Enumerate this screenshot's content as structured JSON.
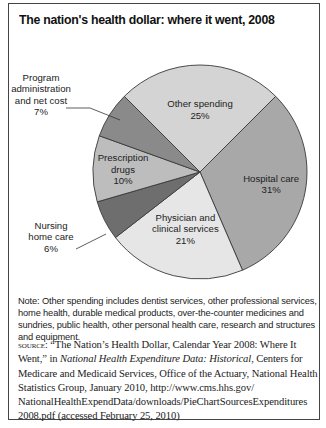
{
  "chart_data": {
    "type": "pie",
    "title": "The nation's health dollar: where it went, 2008",
    "start_angle_deg": 45,
    "direction": "clockwise",
    "slices": [
      {
        "label": [
          "Hospital care"
        ],
        "value": 31,
        "value_label": "31%",
        "color": "#a8a8a8",
        "label_inside": true
      },
      {
        "label": [
          "Physician and",
          "clinical services"
        ],
        "value": 21,
        "value_label": "21%",
        "color": "#e6e6e6",
        "label_inside": true
      },
      {
        "label": [
          "Nursing",
          "home care"
        ],
        "value": 6,
        "value_label": "6%",
        "color": "#6e6e6e",
        "label_inside": false
      },
      {
        "label": [
          "Prescription",
          "drugs"
        ],
        "value": 10,
        "value_label": "10%",
        "color": "#bdbdbd",
        "label_inside": true
      },
      {
        "label": [
          "Program",
          "administration",
          "and net cost"
        ],
        "value": 7,
        "value_label": "7%",
        "color": "#8a8a8a",
        "label_inside": false
      },
      {
        "label": [
          "Other spending"
        ],
        "value": 25,
        "value_label": "25%",
        "color": "#d4d4d4",
        "label_inside": true
      }
    ]
  },
  "note": "Note: Other spending includes dentist services, other professional services, home health, durable medical products, over-the-counter medicines and sundries, public health, other personal health care, research and structures and equipment.",
  "source": {
    "prefix": "Source:",
    "part1": " “The Nation’s Health Dollar, Calendar Year 2008: Where It Went,” in ",
    "italic": "National Health Expenditure Data: Historical",
    "part2": ", Centers for Medicare and Medicaid Services, Office of the Actuary, National Health Statistics Group, January 2010, http://www.cms.hhs.gov/ NationalHealthExpendData/downloads/PieChartSourcesExpenditures 2008.pdf (accessed February 25, 2010)"
  }
}
